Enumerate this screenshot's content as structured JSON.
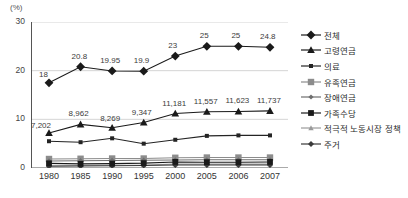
{
  "chart_data": {
    "type": "line",
    "title": "",
    "xlabel": "",
    "ylabel": "(%)",
    "unit_label": "(%)",
    "categories": [
      "1980",
      "1985",
      "1990",
      "1995",
      "2000",
      "2005",
      "2006",
      "2007"
    ],
    "ylim": [
      0,
      30
    ],
    "yticks": [
      0,
      10,
      20,
      30
    ],
    "ytick_labels": [
      "0",
      "10",
      "20",
      "30"
    ],
    "grid": "horizontal",
    "legend_position": "right",
    "series": [
      {
        "name": "전체",
        "marker": "diamond",
        "color": "#1a1a1a",
        "values": [
          17.5,
          20.8,
          19.95,
          19.9,
          23.0,
          25.0,
          25.0,
          24.8
        ],
        "labels": [
          "18",
          "20.8",
          "19.95",
          "19.9",
          "23",
          "25",
          "25",
          "24.8"
        ]
      },
      {
        "name": "고령연금",
        "marker": "triangle",
        "color": "#1a1a1a",
        "values": [
          7.202,
          8.962,
          8.269,
          9.347,
          11.181,
          11.557,
          11.623,
          11.737
        ],
        "labels": [
          "7,202",
          "8,962",
          "8,269",
          "9,347",
          "11,181",
          "11,557",
          "11,623",
          "11,737"
        ]
      },
      {
        "name": "의료",
        "marker": "small-square",
        "color": "#242424",
        "values": [
          5.5,
          5.3,
          6.1,
          5.0,
          5.8,
          6.6,
          6.7,
          6.7
        ],
        "labels": []
      },
      {
        "name": "유족연금",
        "marker": "square",
        "color": "#8c8c8c",
        "values": [
          1.85,
          1.9,
          1.95,
          1.95,
          2.1,
          2.15,
          2.15,
          2.15
        ],
        "labels": []
      },
      {
        "name": "장애연금",
        "marker": "small-diamond",
        "color": "#6e6e6e",
        "values": [
          1.45,
          1.5,
          1.55,
          1.6,
          1.65,
          1.7,
          1.7,
          1.7
        ],
        "labels": []
      },
      {
        "name": "가족수당",
        "marker": "filled-square",
        "color": "#1a1a1a",
        "values": [
          0.95,
          0.85,
          0.9,
          1.0,
          1.25,
          1.2,
          1.2,
          1.25
        ],
        "labels": []
      },
      {
        "name": "적극적 노동시장 정책",
        "marker": "small-triangle",
        "color": "#9a9a9a",
        "values": [
          0.45,
          0.5,
          0.55,
          0.6,
          0.8,
          0.8,
          0.8,
          0.8
        ],
        "labels": []
      },
      {
        "name": "주거",
        "marker": "cross-diamond",
        "color": "#3a3a3a",
        "values": [
          0.35,
          0.4,
          0.45,
          0.5,
          0.6,
          0.6,
          0.6,
          0.6
        ],
        "labels": []
      }
    ]
  },
  "legend": {
    "items": [
      {
        "label": "전체"
      },
      {
        "label": "고령연금"
      },
      {
        "label": "의료"
      },
      {
        "label": "유족연금"
      },
      {
        "label": "장애연금"
      },
      {
        "label": "가족수당"
      },
      {
        "label": "적극적 노동시장 정책"
      },
      {
        "label": "주거"
      }
    ]
  }
}
